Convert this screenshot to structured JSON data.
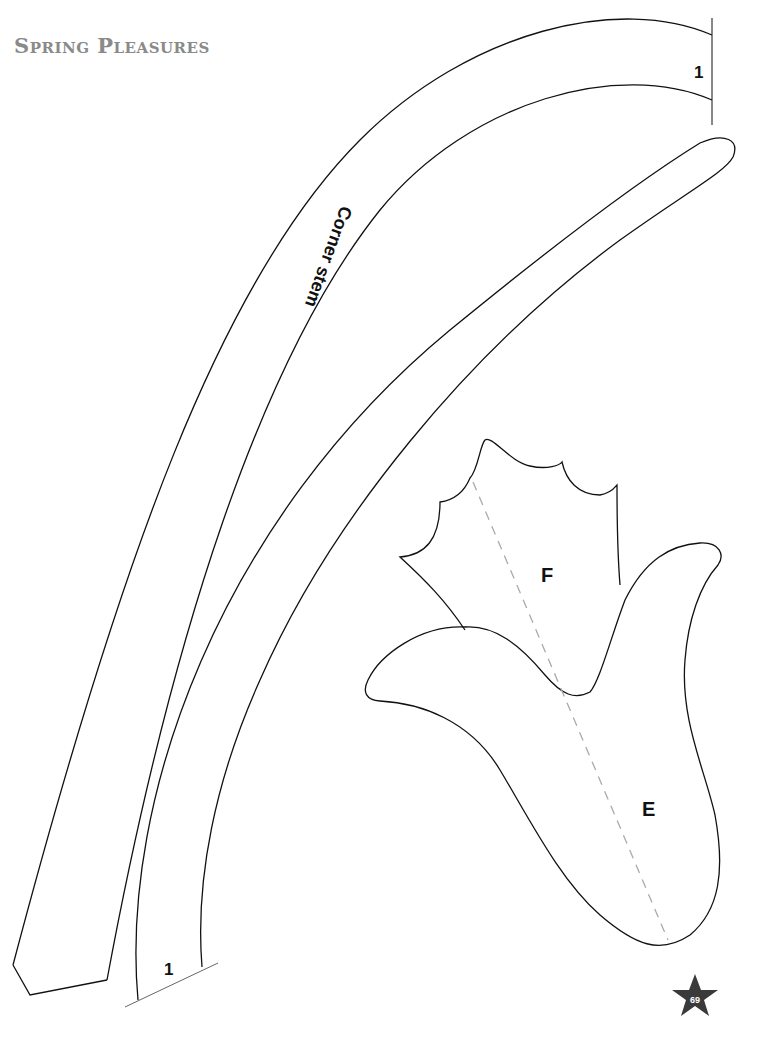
{
  "header": {
    "title": "Spring Pleasures"
  },
  "pattern_pieces": {
    "stem": {
      "label": "Corner stem",
      "top_mark": "1",
      "bottom_mark": "1"
    },
    "flower_top": {
      "label": "F"
    },
    "flower_bottom": {
      "label": "E"
    }
  },
  "footer": {
    "page_number": "69",
    "star_color": "#3a3a3a"
  },
  "colors": {
    "outline": "#111111",
    "dashed_line": "#aaaaaa",
    "title_gray": "#8a8a8a"
  }
}
